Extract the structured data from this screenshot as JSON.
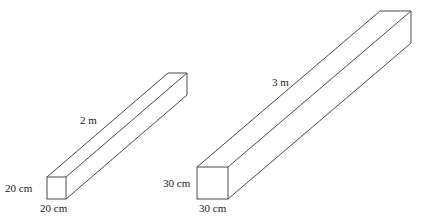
{
  "colors": {
    "stroke": "#4a4a4a",
    "text": "#222222",
    "background": "#ffffff"
  },
  "prisms": [
    {
      "name": "small-prism",
      "front": {
        "x1": 47,
        "y1": 177,
        "x2": 66,
        "y2": 199
      },
      "offset": {
        "dx": 121,
        "dy": -104
      },
      "labels": {
        "length": {
          "text": "2 m",
          "x": 80,
          "y": 115
        },
        "height": {
          "text": "20 cm",
          "x": 5,
          "y": 183
        },
        "width": {
          "text": "20 cm",
          "x": 40,
          "y": 203
        }
      }
    },
    {
      "name": "large-prism",
      "front": {
        "x1": 197,
        "y1": 167,
        "x2": 228,
        "y2": 199
      },
      "offset": {
        "dx": 183,
        "dy": -156
      },
      "labels": {
        "length": {
          "text": "3 m",
          "x": 272,
          "y": 77
        },
        "height": {
          "text": "30 cm",
          "x": 163,
          "y": 178
        },
        "width": {
          "text": "30 cm",
          "x": 199,
          "y": 203
        }
      }
    }
  ]
}
